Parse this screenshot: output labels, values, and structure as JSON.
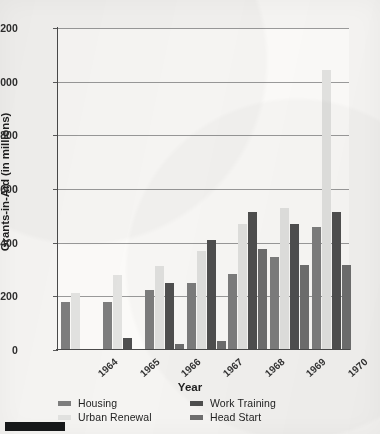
{
  "chart_data": {
    "type": "bar",
    "title": "",
    "xlabel": "Year",
    "ylabel": "Grants-in-Aid (in millions)",
    "categories": [
      "1964",
      "1965",
      "1966",
      "1967",
      "1968",
      "1969",
      "1970"
    ],
    "ylim": [
      0,
      1200
    ],
    "yticks": [
      0,
      200,
      400,
      600,
      800,
      1000,
      1200
    ],
    "ytick_labels": [
      "0",
      "200",
      "400",
      "600",
      "800",
      "1000",
      "1200"
    ],
    "grid": "horizontal",
    "legend_position": "below-axis",
    "series": [
      {
        "name": "Housing",
        "color": "#7d7d7d",
        "values": [
          180,
          180,
          225,
          248,
          283,
          345,
          458
        ]
      },
      {
        "name": "Urban Renewal",
        "color": "#e2e2e0",
        "values": [
          212,
          280,
          312,
          370,
          468,
          530,
          1045
        ]
      },
      {
        "name": "Work Training",
        "color": "#4f4f4f",
        "values": [
          2,
          45,
          250,
          410,
          515,
          468,
          513
        ]
      },
      {
        "name": "Head Start",
        "color": "#6e6e6e",
        "values": [
          2,
          5,
          22,
          35,
          378,
          318,
          315
        ]
      }
    ]
  },
  "legend": {
    "items": [
      {
        "label": "Housing",
        "color": "#7d7d7d"
      },
      {
        "label": "Work Training",
        "color": "#4f4f4f"
      },
      {
        "label": "Urban Renewal",
        "color": "#e2e2e0"
      },
      {
        "label": "Head Start",
        "color": "#6e6e6e"
      }
    ]
  },
  "page": {
    "background_color": "#f5f4f2",
    "axis_color": "#4a4a4a",
    "grid_color": "#9a9a9a"
  }
}
